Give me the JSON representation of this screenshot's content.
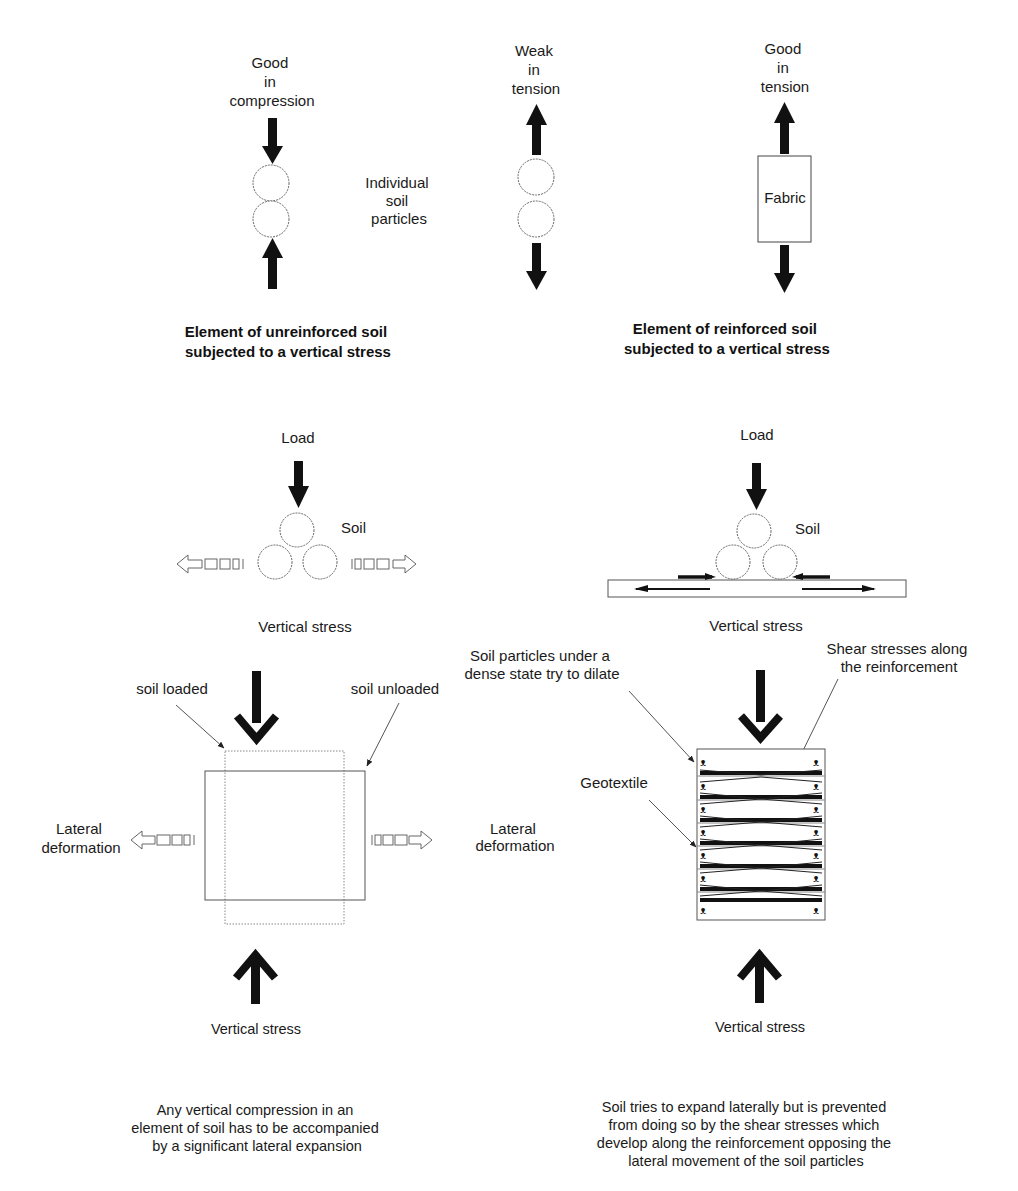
{
  "top_left": {
    "top_label": [
      "Good",
      "in",
      "compression"
    ],
    "middle_label": [
      "Individual",
      "soil",
      "particles"
    ],
    "caption": [
      "Element of unreinforced soil",
      "subjected to a vertical stress"
    ]
  },
  "top_middle": {
    "top_label": [
      "Weak",
      "in",
      "tension"
    ]
  },
  "top_right": {
    "top_label": [
      "Good",
      "in",
      "tension"
    ],
    "box_label": "Fabric",
    "caption": [
      "Element of reinforced soil",
      "subjected to a vertical stress"
    ]
  },
  "mid_left": {
    "load_label": "Load",
    "soil_label": "Soil",
    "stress_label": "Vertical stress"
  },
  "mid_right": {
    "load_label": "Load",
    "soil_label": "Soil",
    "stress_label": "Vertical stress"
  },
  "bottom_left": {
    "soil_loaded": "soil loaded",
    "soil_unloaded": "soil unloaded",
    "lateral_left": [
      "Lateral",
      "deformation"
    ],
    "lateral_right": [
      "Lateral",
      "deformation"
    ],
    "stress_label": "Vertical stress",
    "caption": [
      "Any vertical compression in an",
      "element of soil has to be accompanied",
      "by a significant lateral expansion"
    ]
  },
  "bottom_right": {
    "dilate_label": [
      "Soil particles under a",
      "dense state try to dilate"
    ],
    "shear_label": [
      "Shear stresses along",
      "the reinforcement"
    ],
    "geotextile_label": "Geotextile",
    "stress_label": "Vertical stress",
    "caption": [
      "Soil tries to expand laterally but is prevented",
      "from doing so by the shear stresses which",
      "develop along the reinforcement opposing the",
      "lateral movement of the soil particles"
    ]
  }
}
